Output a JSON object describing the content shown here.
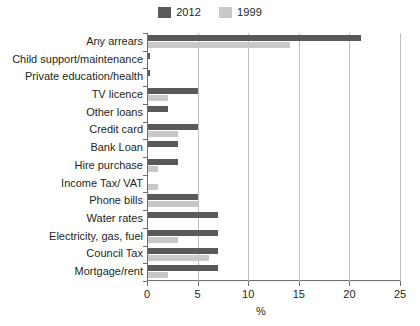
{
  "chart_data": {
    "type": "bar",
    "orientation": "horizontal",
    "title": "",
    "subtitle": "",
    "xlabel": "%",
    "ylabel": "",
    "xlim": [
      0,
      25
    ],
    "xticks": [
      0,
      5,
      10,
      15,
      20,
      25
    ],
    "xtick_labels": [
      "0",
      "5",
      "10",
      "15",
      "20",
      "25"
    ],
    "grid": true,
    "grid_axis": "x",
    "legend_position": "top-center",
    "categories": [
      "Any arrears",
      "Child support/maintenance",
      "Private education/health",
      "TV licence",
      "Other loans",
      "Credit card",
      "Bank Loan",
      "Hire purchase",
      "Income Tax/ VAT",
      "Phone bills",
      "Water rates",
      "Electricity, gas, fuel",
      "Council Tax",
      "Mortgage/rent"
    ],
    "series": [
      {
        "name": "2012",
        "color": "#595959",
        "values": [
          21.0,
          0.2,
          0.2,
          4.9,
          2.0,
          4.9,
          3.0,
          3.0,
          0.0,
          4.9,
          6.9,
          6.9,
          6.9,
          6.9
        ]
      },
      {
        "name": "1999",
        "color": "#c8c8c8",
        "values": [
          14.0,
          0.0,
          0.0,
          2.0,
          0.0,
          3.0,
          0.0,
          1.0,
          1.0,
          4.9,
          0.0,
          3.0,
          6.0,
          2.0
        ]
      }
    ]
  },
  "legend": {
    "entries": [
      {
        "label": "2012",
        "color": "#595959"
      },
      {
        "label": "1999",
        "color": "#c8c8c8"
      }
    ]
  },
  "axis": {
    "x_title": "%"
  }
}
